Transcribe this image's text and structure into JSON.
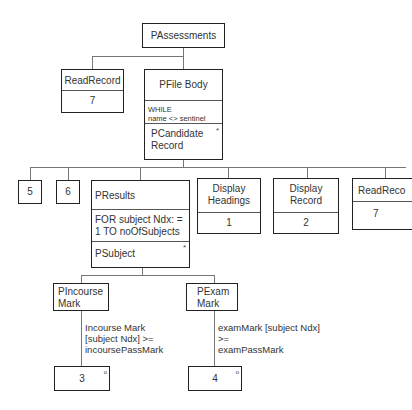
{
  "diagram": {
    "type": "Jackson structure chart",
    "root": {
      "label": "PAssessments"
    },
    "level1": {
      "read_record": {
        "label": "ReadRecord",
        "op": "7"
      },
      "file_body": {
        "label": "PFile Body",
        "condition_line1": "WHILE",
        "condition_line2": "name <> sentinel",
        "child_line1": "PCandidate",
        "child_line2": "Record",
        "iteration_marker": "*"
      }
    },
    "level2": {
      "op5": "5",
      "op6": "6",
      "results": {
        "label": "PResults",
        "condition_line1": "FOR subject Ndx: =",
        "condition_line2": "1 TO noOfSubjects",
        "child": "PSubject",
        "iteration_marker": "*"
      },
      "display_headings": {
        "line1": "Display",
        "line2": "Headings",
        "op": "1"
      },
      "display_record": {
        "line1": "Display",
        "line2": "Record",
        "op": "2"
      },
      "read_record": {
        "label": "ReadReco",
        "op": "7"
      }
    },
    "level3": {
      "incourse": {
        "line1": "PIncourse",
        "line2": "Mark",
        "cond_line1": "Incourse Mark",
        "cond_line2": "[subject Ndx] >=",
        "cond_line3": "incoursePassMark",
        "op": "3",
        "selection_marker": "o"
      },
      "exam": {
        "line1": "PExam",
        "line2": "Mark",
        "cond_line1": "examMark [subject Ndx]",
        "cond_line2": ">=",
        "cond_line3": "examPassMark",
        "op": "4",
        "selection_marker": "o"
      }
    }
  }
}
